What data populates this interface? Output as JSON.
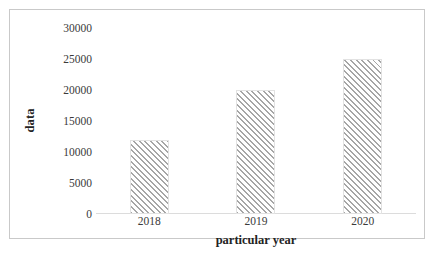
{
  "chart_data": {
    "type": "bar",
    "title": "",
    "categories": [
      "2018",
      "2019",
      "2020"
    ],
    "values": [
      12000,
      20000,
      25000
    ],
    "series": [
      {
        "name": "data",
        "values": [
          12000,
          20000,
          25000
        ]
      }
    ],
    "xlabel": "particular year",
    "ylabel": "data",
    "ylim": [
      0,
      30000
    ],
    "ytick_labels": [
      "30000",
      "25000",
      "20000",
      "15000",
      "10000",
      "5000",
      "0"
    ],
    "ytick_values": [
      30000,
      25000,
      20000,
      15000,
      10000,
      5000,
      0
    ],
    "ytick_step": 5000,
    "grid": false,
    "legend": false,
    "legend_position": "none",
    "bar_fill": "diagonal-hatch",
    "bar_hatch_color": "#a6a6a6",
    "bar_background_color": "#ffffff",
    "frame_border_color": "#c9c9c9",
    "text_color": "#2b2b2b"
  },
  "axes": {
    "y_title": "data",
    "x_title": "particular year"
  },
  "caption": {
    "text": ""
  }
}
